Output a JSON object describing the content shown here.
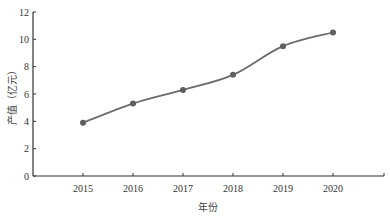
{
  "chart_data": {
    "type": "line",
    "title": "",
    "xlabel": "年份",
    "ylabel": "产值（亿元）",
    "categories": [
      "2015",
      "2016",
      "2017",
      "2018",
      "2019",
      "2020"
    ],
    "series": [
      {
        "name": "产值",
        "values": [
          3.9,
          5.3,
          6.3,
          7.4,
          9.5,
          10.5
        ]
      }
    ],
    "yticks": [
      0,
      2,
      4,
      6,
      8,
      10,
      12
    ],
    "ylim": [
      0,
      12
    ],
    "grid": false,
    "legend": null,
    "colors": {
      "line": "#6b6b6b",
      "marker": "#5e5e5e",
      "axis": "#333333"
    }
  }
}
